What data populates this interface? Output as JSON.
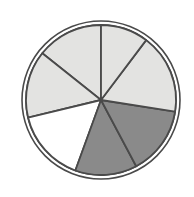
{
  "figure": {
    "background_color": "#ffffff",
    "width": 194,
    "height": 197
  },
  "chart_data": {
    "type": "pie",
    "title": "",
    "subtitle": "",
    "xlabel": "",
    "ylabel": "",
    "legend": "none",
    "grid": false,
    "center": {
      "x": 101,
      "y": 100
    },
    "outer_ring": {
      "outer_radius": 79,
      "inner_radius": 75,
      "stroke_color": "#4a4a4a",
      "fill_color": "#ffffff",
      "stroke_width": 1.6
    },
    "pie_radius": 75,
    "slice_stroke_color": "#4a4a4a",
    "slice_stroke_width": 1.8,
    "units": "degrees",
    "start_angle_deg": 90,
    "direction": "counterclockwise",
    "categories": [
      "Sector 1",
      "Sector 2",
      "Sector 3",
      "Sector 4",
      "Sector 5",
      "Sector 6",
      "Sector 7"
    ],
    "boundary_angles_deg": [
      90,
      141.5,
      193.5,
      250,
      298,
      351,
      413
    ],
    "values": [
      51.5,
      52,
      56.5,
      48,
      53,
      62,
      37
    ],
    "colors": [
      "#e3e3e1",
      "#e3e3e1",
      "#ffffff",
      "#8a8a8a",
      "#8a8a8a",
      "#e3e3e1",
      "#e3e3e1"
    ],
    "slices": [
      {
        "label": "Sector 1",
        "start_deg": 90,
        "end_deg": 141.5,
        "sweep_deg": 51.5,
        "color": "#e3e3e1",
        "shade": "light-gray"
      },
      {
        "label": "Sector 2",
        "start_deg": 141.5,
        "end_deg": 193.5,
        "sweep_deg": 52,
        "color": "#e3e3e1",
        "shade": "light-gray"
      },
      {
        "label": "Sector 3",
        "start_deg": 193.5,
        "end_deg": 250,
        "sweep_deg": 56.5,
        "color": "#ffffff",
        "shade": "white"
      },
      {
        "label": "Sector 4",
        "start_deg": 250,
        "end_deg": 298,
        "sweep_deg": 48,
        "color": "#8a8a8a",
        "shade": "dark-gray"
      },
      {
        "label": "Sector 5",
        "start_deg": 298,
        "end_deg": 351,
        "sweep_deg": 53,
        "color": "#8a8a8a",
        "shade": "dark-gray"
      },
      {
        "label": "Sector 6",
        "start_deg": 351,
        "end_deg": 413,
        "sweep_deg": 62,
        "color": "#e3e3e1",
        "shade": "light-gray"
      },
      {
        "label": "Sector 7",
        "start_deg": 413,
        "end_deg": 450,
        "sweep_deg": 37,
        "color": "#e3e3e1",
        "shade": "light-gray"
      }
    ]
  }
}
